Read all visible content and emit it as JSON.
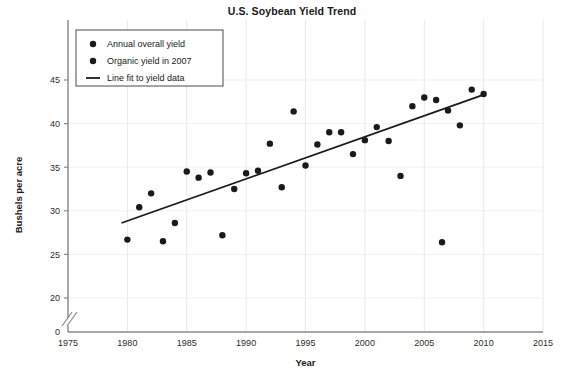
{
  "chart_data": {
    "type": "scatter",
    "title": "U.S. Soybean Yield Trend",
    "xlabel": "Year",
    "ylabel": "Bushels per acre",
    "xlim": [
      1975,
      2015
    ],
    "ylim": [
      0,
      47
    ],
    "y_axis_break": true,
    "y_break_between": [
      0,
      20
    ],
    "xticks": [
      1975,
      1980,
      1985,
      1990,
      1995,
      2000,
      2005,
      2010,
      2015
    ],
    "yticks": [
      0,
      20,
      25,
      30,
      35,
      40,
      45
    ],
    "grid": true,
    "legend_position": "top-left",
    "legend": [
      {
        "label": "Annual overall yield",
        "marker": "dot",
        "color": "#1a1a1a"
      },
      {
        "label": "Organic yield in 2007",
        "marker": "dot",
        "color": "#1a1a1a"
      },
      {
        "label": "Line fit to yield data",
        "marker": "line",
        "color": "#1a1a1a"
      }
    ],
    "series": [
      {
        "name": "Annual overall yield",
        "marker": "dot",
        "points": [
          {
            "x": 1980.0,
            "y": 26.7
          },
          {
            "x": 1981.0,
            "y": 30.4
          },
          {
            "x": 1982.0,
            "y": 32.0
          },
          {
            "x": 1983.0,
            "y": 26.5
          },
          {
            "x": 1984.0,
            "y": 28.6
          },
          {
            "x": 1985.0,
            "y": 34.5
          },
          {
            "x": 1986.0,
            "y": 33.8
          },
          {
            "x": 1987.0,
            "y": 34.4
          },
          {
            "x": 1988.0,
            "y": 27.2
          },
          {
            "x": 1989.0,
            "y": 32.5
          },
          {
            "x": 1990.0,
            "y": 34.3
          },
          {
            "x": 1991.0,
            "y": 34.6
          },
          {
            "x": 1992.0,
            "y": 37.7
          },
          {
            "x": 1993.0,
            "y": 32.7
          },
          {
            "x": 1994.0,
            "y": 41.4
          },
          {
            "x": 1995.0,
            "y": 35.2
          },
          {
            "x": 1996.0,
            "y": 37.6
          },
          {
            "x": 1997.0,
            "y": 39.0
          },
          {
            "x": 1998.0,
            "y": 39.0
          },
          {
            "x": 1999.0,
            "y": 36.5
          },
          {
            "x": 2000.0,
            "y": 38.1
          },
          {
            "x": 2001.0,
            "y": 39.6
          },
          {
            "x": 2002.0,
            "y": 38.0
          },
          {
            "x": 2003.0,
            "y": 34.0
          },
          {
            "x": 2004.0,
            "y": 42.0
          },
          {
            "x": 2005.0,
            "y": 43.0
          },
          {
            "x": 2006.0,
            "y": 42.7
          },
          {
            "x": 2007.0,
            "y": 41.5
          },
          {
            "x": 2008.0,
            "y": 39.8
          },
          {
            "x": 2009.0,
            "y": 43.9
          },
          {
            "x": 2010.0,
            "y": 43.4
          }
        ]
      },
      {
        "name": "Organic yield in 2007",
        "marker": "dot",
        "points": [
          {
            "x": 2006.5,
            "y": 26.4
          }
        ]
      }
    ],
    "fit_line": {
      "name": "Line fit to yield data",
      "x_start": 1979.5,
      "y_start": 28.6,
      "x_end": 2010.2,
      "y_end": 43.4
    }
  }
}
